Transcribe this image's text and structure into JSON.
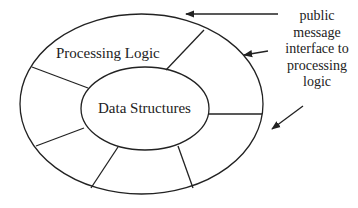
{
  "diagram": {
    "outer_ring_label": "Processing Logic",
    "inner_core_label": "Data Structures",
    "annotation": {
      "lines": [
        "public",
        "message",
        "interface to",
        "processing",
        "logic"
      ],
      "text": "public message interface to processing logic"
    },
    "colors": {
      "stroke": "#222222",
      "background": "#ffffff",
      "text": "#222222"
    },
    "shapes": {
      "outer_ellipse": {
        "cx": 141.5,
        "cy": 104,
        "rx": 121.5,
        "ry": 90
      },
      "inner_ellipse": {
        "cx": 145,
        "cy": 108.5,
        "rx": 64,
        "ry": 41.5
      },
      "spokes": [
        {
          "x1": 32,
          "y1": 67,
          "x2": 88,
          "y2": 88
        },
        {
          "x1": 204,
          "y1": 30,
          "x2": 166,
          "y2": 70
        },
        {
          "x1": 209,
          "y1": 114,
          "x2": 262,
          "y2": 114
        },
        {
          "x1": 36,
          "y1": 146,
          "x2": 84,
          "y2": 128
        },
        {
          "x1": 91,
          "y1": 188,
          "x2": 118,
          "y2": 147
        },
        {
          "x1": 178,
          "y1": 146,
          "x2": 193,
          "y2": 188
        }
      ],
      "arrows": [
        {
          "x1": 278,
          "y1": 14,
          "x2": 186,
          "y2": 14
        },
        {
          "x1": 268,
          "y1": 51,
          "x2": 244,
          "y2": 55
        },
        {
          "x1": 303,
          "y1": 106,
          "x2": 272,
          "y2": 129
        }
      ]
    }
  }
}
